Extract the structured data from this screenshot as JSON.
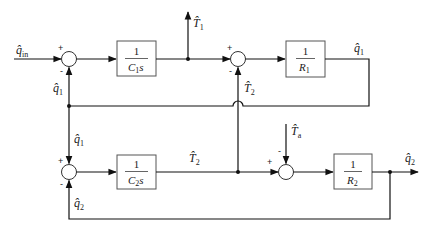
{
  "diagram": {
    "type": "block-diagram",
    "blocks": [
      {
        "id": "C1s",
        "numerator": "1",
        "denominator": "C",
        "den_sub": "1",
        "den_suffix": "s"
      },
      {
        "id": "R1",
        "numerator": "1",
        "denominator": "R",
        "den_sub": "1",
        "den_suffix": ""
      },
      {
        "id": "C2s",
        "numerator": "1",
        "denominator": "C",
        "den_sub": "2",
        "den_suffix": "s"
      },
      {
        "id": "R2",
        "numerator": "1",
        "denominator": "R",
        "den_sub": "2",
        "den_suffix": ""
      }
    ],
    "signals": {
      "q_in": {
        "base": "q̂",
        "sub": "in"
      },
      "T1": {
        "base": "T̂",
        "sub": "1"
      },
      "q1_out": {
        "base": "q̂",
        "sub": "1"
      },
      "q1_fb": {
        "base": "q̂",
        "sub": "1"
      },
      "q1_down": {
        "base": "q̂",
        "sub": "1"
      },
      "T2_up": {
        "base": "T̂",
        "sub": "2"
      },
      "T2": {
        "base": "T̂",
        "sub": "2"
      },
      "Ta": {
        "base": "T̂",
        "sub": "a"
      },
      "q2_out": {
        "base": "q̂",
        "sub": "2"
      },
      "q2_fb": {
        "base": "q̂",
        "sub": "2"
      }
    },
    "signs": {
      "plus": "+",
      "minus": "-"
    }
  }
}
